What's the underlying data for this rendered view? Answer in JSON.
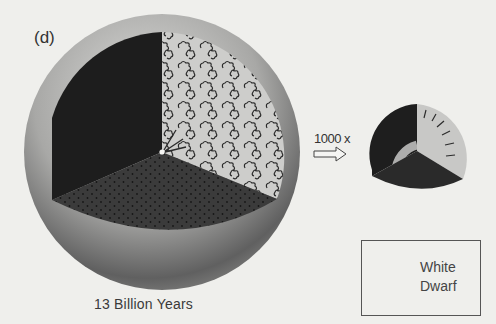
{
  "figure": {
    "panel_label": "(d)",
    "caption": "13 Billion Years",
    "magnification": "1000 x",
    "arrow_icon": "hollow-right-arrow",
    "legend": {
      "line1": "White",
      "line2": "Dwarf",
      "icon": "white-dwarf-sphere-icon"
    },
    "colors": {
      "background": "#efefec",
      "sphere_light": "#d2d2d0",
      "sphere_dark": "#4a4a4a",
      "sector_dark": "#1e1e1e",
      "sector_dotted": "#3a3a3a",
      "sector_light": "#cfcfcd"
    }
  }
}
